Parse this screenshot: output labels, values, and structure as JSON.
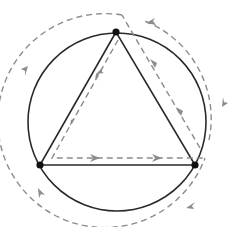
{
  "diagram": {
    "colors": {
      "solid": "#2a2a2a",
      "dashed": "#8c8c8c",
      "vertex": "#111111",
      "background": "#ffffff"
    },
    "circle": {
      "cx": 117,
      "cy": 122,
      "r": 89
    },
    "vertices": [
      {
        "id": "top",
        "x": 116,
        "y": 32
      },
      {
        "id": "bottom-left",
        "x": 40,
        "y": 165
      },
      {
        "id": "bottom-right",
        "x": 195,
        "y": 165
      }
    ],
    "edges": [
      {
        "from": "top",
        "to": "bottom-left"
      },
      {
        "from": "bottom-left",
        "to": "bottom-right"
      },
      {
        "from": "bottom-right",
        "to": "top"
      }
    ],
    "outer_dashed_loop": {
      "cx": 117,
      "cy": 122,
      "r": 105,
      "direction": "counter-clockwise"
    }
  }
}
